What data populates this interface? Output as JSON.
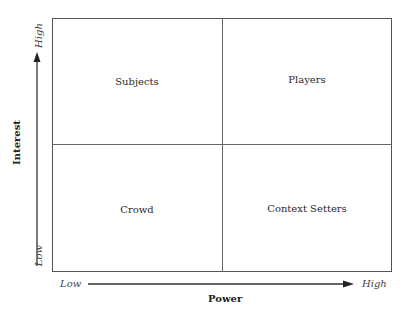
{
  "diagram": {
    "type": "2x2 matrix",
    "x_axis": {
      "title": "Power",
      "low_label": "Low",
      "high_label": "High"
    },
    "y_axis": {
      "title": "Interest",
      "low_label": "Low",
      "high_label": "High"
    },
    "quadrants": {
      "top_left": "Subjects",
      "top_right": "Players",
      "bottom_left": "Crowd",
      "bottom_right": "Context Setters"
    }
  },
  "colors": {
    "line": "#555555",
    "text": "#2a2a2a"
  }
}
